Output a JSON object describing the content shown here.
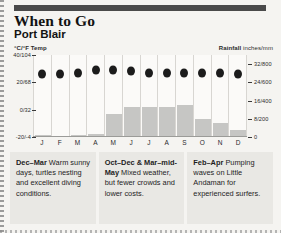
{
  "header": {
    "title": "When to Go",
    "subtitle": "Port Blair"
  },
  "legends": {
    "temp_label": "°C/°F Temp",
    "rain_label_bold": "Rainfall",
    "rain_label_rest": " inches/mm"
  },
  "chart_data": {
    "type": "bar",
    "xlabel": "",
    "ylabel": "°C/°F Temp",
    "y2label": "Rainfall inches/mm",
    "grid": false,
    "legend_position": "top",
    "categories": [
      "J",
      "F",
      "M",
      "A",
      "M",
      "J",
      "J",
      "A",
      "S",
      "O",
      "N",
      "D"
    ],
    "left_axis_ticks": [
      "40/104",
      "20/68",
      "0/32",
      "-20/-4"
    ],
    "left_axis_values": [
      40,
      20,
      0,
      -20
    ],
    "ylim": [
      -20,
      40
    ],
    "right_axis_ticks": [
      "32/800",
      "24/600",
      "16/400",
      "8/200",
      "0"
    ],
    "right_axis_values": [
      32,
      24,
      16,
      8,
      0
    ],
    "y2lim": [
      0,
      36
    ],
    "series": [
      {
        "name": "Rainfall",
        "type": "bar",
        "unit": "inches",
        "values": [
          1,
          0.5,
          0.8,
          1.5,
          10,
          13,
          13,
          13,
          14,
          8,
          6,
          3
        ]
      },
      {
        "name": "Temperature",
        "type": "scatter",
        "unit": "°C",
        "values": [
          26,
          26,
          27,
          29,
          29,
          28,
          27,
          27,
          27,
          27,
          27,
          26
        ]
      }
    ]
  },
  "notes": [
    {
      "lead": "Dec–Mar",
      "text": " Warm sunny days, turtles nesting and excellent diving conditions."
    },
    {
      "lead": "Oct–Dec & Mar–mid-May",
      "text": " Mixed weather, but fewer crowds and lower costs."
    },
    {
      "lead": "Feb–Apr",
      "text": " Pumping waves on Little Andaman for experienced surfers."
    }
  ]
}
